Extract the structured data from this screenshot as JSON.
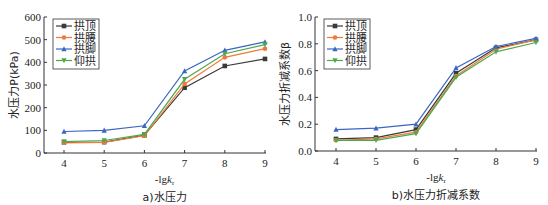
{
  "chart_data": [
    {
      "type": "line",
      "title": "",
      "caption": "a)水压力",
      "xlabel": "-lgk",
      "xlabel_sub": "r",
      "ylabel": "水压力P(kPa)",
      "x": [
        4,
        5,
        6,
        7,
        8,
        9
      ],
      "xlim": [
        3.5,
        9
      ],
      "ylim": [
        0,
        600
      ],
      "yticks": [
        0,
        100,
        200,
        300,
        400,
        500,
        600
      ],
      "ytick_labels": [
        "0",
        "100",
        "200",
        "300",
        "400",
        "500",
        "600"
      ],
      "xticks": [
        4,
        5,
        6,
        7,
        8,
        9
      ],
      "grid": false,
      "legend_position": "upper left",
      "series": [
        {
          "name": "拱顶",
          "color": "#3a3a3a",
          "marker": "square",
          "values": [
            47,
            48,
            78,
            288,
            384,
            415
          ]
        },
        {
          "name": "拱腰",
          "color": "#f07a3a",
          "marker": "circle",
          "values": [
            45,
            47,
            76,
            305,
            422,
            460
          ]
        },
        {
          "name": "拱脚",
          "color": "#3a66c4",
          "marker": "triangle-up",
          "values": [
            95,
            100,
            120,
            362,
            453,
            490
          ]
        },
        {
          "name": "仰拱",
          "color": "#4caa4c",
          "marker": "triangle-down",
          "values": [
            50,
            55,
            82,
            325,
            438,
            478
          ]
        }
      ]
    },
    {
      "type": "line",
      "title": "",
      "caption": "b)水压力折减系数",
      "xlabel": "-lgk",
      "xlabel_sub": "r",
      "ylabel": "水压力折减系数β",
      "x": [
        4,
        5,
        6,
        7,
        8,
        9
      ],
      "xlim": [
        3.5,
        9
      ],
      "ylim": [
        0,
        1.0
      ],
      "yticks": [
        0,
        0.2,
        0.4,
        0.6,
        0.8,
        1.0
      ],
      "ytick_labels": [
        "0.0",
        "0.2",
        "0.4",
        "0.6",
        "0.8",
        "1.0"
      ],
      "xticks": [
        4,
        5,
        6,
        7,
        8,
        9
      ],
      "grid": false,
      "legend_position": "upper left",
      "series": [
        {
          "name": "拱顶",
          "color": "#3a3a3a",
          "marker": "square",
          "values": [
            0.09,
            0.1,
            0.16,
            0.58,
            0.77,
            0.83
          ]
        },
        {
          "name": "拱腰",
          "color": "#f07a3a",
          "marker": "circle",
          "values": [
            0.08,
            0.09,
            0.14,
            0.56,
            0.76,
            0.83
          ]
        },
        {
          "name": "拱脚",
          "color": "#3a66c4",
          "marker": "triangle-up",
          "values": [
            0.16,
            0.17,
            0.2,
            0.62,
            0.78,
            0.84
          ]
        },
        {
          "name": "仰拱",
          "color": "#4caa4c",
          "marker": "triangle-down",
          "values": [
            0.08,
            0.08,
            0.13,
            0.55,
            0.74,
            0.81
          ]
        }
      ]
    }
  ]
}
